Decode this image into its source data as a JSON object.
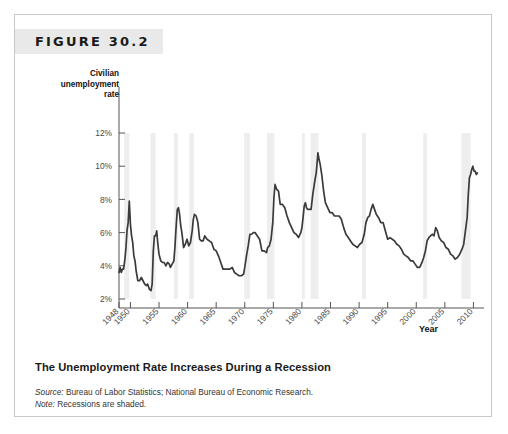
{
  "figure": {
    "number_label": "FIGURE 30.2",
    "caption_title": "The Unemployment Rate Increases During a Recession",
    "source_key": "Source:",
    "source_text": " Bureau of Labor Statistics; National Bureau of Economic Research.",
    "note_key": "Note:",
    "note_text": " Recessions are shaded.",
    "y_axis_title": "Civilian unemployment rate",
    "x_axis_title": "Year"
  },
  "chart_data": {
    "type": "line",
    "title": "The Unemployment Rate Increases During a Recession",
    "xlabel": "Year",
    "ylabel": "Civilian unemployment rate",
    "xlim": [
      1948,
      2010.8
    ],
    "ylim": [
      2,
      12
    ],
    "grid": false,
    "legend": "none",
    "line_color": "#3a3a3a",
    "recession_band_color": "#eeeeee",
    "y_ticks": [
      2,
      4,
      6,
      8,
      10,
      12
    ],
    "y_tick_labels": [
      "2%",
      "4%",
      "6%",
      "8%",
      "10%",
      "12%"
    ],
    "x_ticks": [
      1948,
      1950,
      1955,
      1960,
      1965,
      1970,
      1975,
      1980,
      1985,
      1990,
      1995,
      2000,
      2005,
      2010
    ],
    "x_tick_labels": [
      "1948",
      "1950",
      "1955",
      "1960",
      "1965",
      "1970",
      "1975",
      "1980",
      "1985",
      "1990",
      "1995",
      "2000",
      "2005",
      "2010"
    ],
    "annotations": [
      "Recessions are shaded."
    ],
    "recessions": [
      {
        "start": 1948.9,
        "end": 1949.8,
        "label": "1948-49"
      },
      {
        "start": 1953.5,
        "end": 1954.4,
        "label": "1953-54"
      },
      {
        "start": 1957.6,
        "end": 1958.3,
        "label": "1957-58"
      },
      {
        "start": 1960.3,
        "end": 1961.1,
        "label": "1960-61"
      },
      {
        "start": 1969.9,
        "end": 1970.9,
        "label": "1969-70"
      },
      {
        "start": 1973.9,
        "end": 1975.2,
        "label": "1973-75"
      },
      {
        "start": 1980.0,
        "end": 1980.5,
        "label": "1980"
      },
      {
        "start": 1981.5,
        "end": 1982.9,
        "label": "1981-82"
      },
      {
        "start": 1990.5,
        "end": 1991.2,
        "label": "1990-91"
      },
      {
        "start": 2001.2,
        "end": 2001.9,
        "label": "2001"
      },
      {
        "start": 2007.9,
        "end": 2009.5,
        "label": "2007-09"
      }
    ],
    "series": [
      {
        "name": "Civilian unemployment rate",
        "units": "percent",
        "x": [
          1948.0,
          1948.2,
          1948.4,
          1948.6,
          1948.8,
          1949.0,
          1949.2,
          1949.4,
          1949.6,
          1949.8,
          1950.0,
          1950.2,
          1950.4,
          1950.6,
          1950.8,
          1951.0,
          1951.3,
          1951.6,
          1951.9,
          1952.2,
          1952.5,
          1952.8,
          1953.0,
          1953.3,
          1953.6,
          1953.8,
          1954.0,
          1954.2,
          1954.4,
          1954.6,
          1954.8,
          1955.0,
          1955.3,
          1955.6,
          1955.9,
          1956.2,
          1956.5,
          1956.8,
          1957.0,
          1957.3,
          1957.6,
          1957.8,
          1958.0,
          1958.2,
          1958.4,
          1958.6,
          1958.8,
          1959.0,
          1959.3,
          1959.6,
          1959.9,
          1960.2,
          1960.5,
          1960.8,
          1961.0,
          1961.2,
          1961.5,
          1961.8,
          1962.1,
          1962.4,
          1962.7,
          1963.0,
          1963.4,
          1963.8,
          1964.2,
          1964.6,
          1965.0,
          1965.4,
          1965.8,
          1966.2,
          1966.6,
          1967.0,
          1967.4,
          1967.8,
          1968.2,
          1968.6,
          1969.0,
          1969.4,
          1969.8,
          1970.0,
          1970.3,
          1970.6,
          1970.9,
          1971.2,
          1971.5,
          1971.8,
          1972.2,
          1972.6,
          1973.0,
          1973.4,
          1973.8,
          1974.0,
          1974.3,
          1974.6,
          1974.9,
          1975.1,
          1975.3,
          1975.6,
          1975.9,
          1976.2,
          1976.6,
          1977.0,
          1977.4,
          1977.8,
          1978.2,
          1978.6,
          1979.0,
          1979.4,
          1979.8,
          1980.0,
          1980.2,
          1980.4,
          1980.6,
          1980.8,
          1981.0,
          1981.3,
          1981.6,
          1981.9,
          1982.2,
          1982.5,
          1982.8,
          1983.0,
          1983.2,
          1983.5,
          1983.8,
          1984.1,
          1984.5,
          1984.9,
          1985.3,
          1985.7,
          1986.1,
          1986.5,
          1986.9,
          1987.3,
          1987.7,
          1988.1,
          1988.5,
          1988.9,
          1989.3,
          1989.7,
          1990.1,
          1990.5,
          1990.9,
          1991.2,
          1991.5,
          1991.8,
          1992.1,
          1992.4,
          1992.7,
          1993.0,
          1993.4,
          1993.8,
          1994.2,
          1994.6,
          1995.0,
          1995.4,
          1995.8,
          1996.2,
          1996.6,
          1997.0,
          1997.4,
          1997.8,
          1998.2,
          1998.6,
          1999.0,
          1999.4,
          1999.8,
          2000.2,
          2000.6,
          2001.0,
          2001.3,
          2001.6,
          2001.9,
          2002.2,
          2002.5,
          2002.8,
          2003.1,
          2003.4,
          2003.7,
          2004.0,
          2004.4,
          2004.8,
          2005.2,
          2005.6,
          2006.0,
          2006.4,
          2006.8,
          2007.2,
          2007.6,
          2008.0,
          2008.3,
          2008.6,
          2008.9,
          2009.1,
          2009.3,
          2009.5,
          2009.7,
          2009.9,
          2010.1,
          2010.3,
          2010.5,
          2010.7
        ],
        "y": [
          3.6,
          3.9,
          3.6,
          3.8,
          3.8,
          4.3,
          5.0,
          6.1,
          6.6,
          7.9,
          6.5,
          5.8,
          5.4,
          4.6,
          4.3,
          3.7,
          3.1,
          3.1,
          3.3,
          3.1,
          2.9,
          2.8,
          2.9,
          2.6,
          2.5,
          2.9,
          4.9,
          5.8,
          5.8,
          6.1,
          5.3,
          4.7,
          4.3,
          4.2,
          4.2,
          4.0,
          4.2,
          4.1,
          3.9,
          4.1,
          4.3,
          5.2,
          6.4,
          7.4,
          7.5,
          7.1,
          6.4,
          6.0,
          5.1,
          5.3,
          5.6,
          5.2,
          5.4,
          6.1,
          6.8,
          7.1,
          7.0,
          6.6,
          5.6,
          5.5,
          5.5,
          5.8,
          5.6,
          5.5,
          5.4,
          5.0,
          4.9,
          4.6,
          4.2,
          3.8,
          3.8,
          3.8,
          3.8,
          3.9,
          3.6,
          3.5,
          3.4,
          3.4,
          3.5,
          3.9,
          4.6,
          5.2,
          5.9,
          5.9,
          6.0,
          6.0,
          5.8,
          5.6,
          4.9,
          4.9,
          4.8,
          5.1,
          5.2,
          5.6,
          6.6,
          8.1,
          8.9,
          8.6,
          8.5,
          7.7,
          7.7,
          7.5,
          7.0,
          6.6,
          6.3,
          6.0,
          5.9,
          5.7,
          6.0,
          6.3,
          6.9,
          7.6,
          7.8,
          7.5,
          7.4,
          7.4,
          7.4,
          8.3,
          9.0,
          9.6,
          10.8,
          10.4,
          10.1,
          9.4,
          8.5,
          7.8,
          7.5,
          7.2,
          7.2,
          7.0,
          7.0,
          7.0,
          6.8,
          6.3,
          5.9,
          5.7,
          5.5,
          5.3,
          5.2,
          5.1,
          5.3,
          5.4,
          5.9,
          6.6,
          6.9,
          7.0,
          7.4,
          7.7,
          7.4,
          7.1,
          6.9,
          6.6,
          6.6,
          6.1,
          5.6,
          5.7,
          5.6,
          5.5,
          5.3,
          5.2,
          5.0,
          4.7,
          4.6,
          4.5,
          4.3,
          4.3,
          4.1,
          3.9,
          3.9,
          4.2,
          4.5,
          4.9,
          5.5,
          5.7,
          5.8,
          5.9,
          5.8,
          6.3,
          6.1,
          5.7,
          5.5,
          5.4,
          5.1,
          5.0,
          4.7,
          4.6,
          4.4,
          4.5,
          4.7,
          5.0,
          5.3,
          6.1,
          6.9,
          8.3,
          9.3,
          9.5,
          9.8,
          10.0,
          9.7,
          9.7,
          9.5,
          9.6
        ],
        "first_value": 3.6,
        "last_value": 9.6,
        "min_value": 2.5,
        "max_value": 10.8,
        "peaks": [
          {
            "year": 1949,
            "value": 7.9
          },
          {
            "year": 1954,
            "value": 6.1
          },
          {
            "year": 1958,
            "value": 7.5
          },
          {
            "year": 1961,
            "value": 7.1
          },
          {
            "year": 1975,
            "value": 9.0
          },
          {
            "year": 1982,
            "value": 10.8
          },
          {
            "year": 1992,
            "value": 7.8
          },
          {
            "year": 2003,
            "value": 6.3
          },
          {
            "year": 2009,
            "value": 10.0
          }
        ],
        "troughs": [
          {
            "year": 1953,
            "value": 2.5
          },
          {
            "year": 1969,
            "value": 3.4
          },
          {
            "year": 1989,
            "value": 5.0
          },
          {
            "year": 2000,
            "value": 3.9
          },
          {
            "year": 2007,
            "value": 4.4
          }
        ]
      }
    ]
  }
}
